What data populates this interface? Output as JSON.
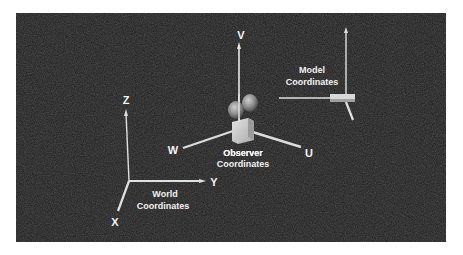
{
  "figure": {
    "background_color": "#1f1f1f",
    "frame_color": "#ffffff",
    "axis_color": "#e8e8e8"
  },
  "world": {
    "caption_line1": "World",
    "caption_line2": "Coordinates",
    "axes": {
      "z": "Z",
      "y": "Y",
      "x": "X"
    }
  },
  "observer": {
    "caption_line1": "Observer",
    "caption_line2": "Coordinates",
    "axes": {
      "v": "V",
      "u": "U",
      "w": "W"
    }
  },
  "model": {
    "caption_line1": "Model",
    "caption_line2": "Coordinates"
  }
}
